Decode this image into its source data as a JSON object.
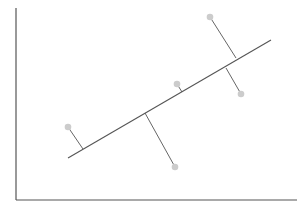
{
  "diagram": {
    "type": "regression-perpendicular-residuals",
    "colors": {
      "background": "#ffffff",
      "axis": "#555555",
      "fit_line": "#555555",
      "residual": "#666666",
      "point": "#cccccc"
    },
    "axes": {
      "y_axis": {
        "x1": 16,
        "y1": 8,
        "x2": 16,
        "y2": 200
      },
      "x_axis": {
        "x1": 16,
        "y1": 200,
        "x2": 297,
        "y2": 200
      }
    },
    "fit_line": {
      "x1": 68,
      "y1": 158,
      "x2": 271,
      "y2": 40
    },
    "points": [
      {
        "x": 68,
        "y": 127,
        "foot_x": 83,
        "foot_y": 149
      },
      {
        "x": 177,
        "y": 84,
        "foot_x": 182,
        "foot_y": 92
      },
      {
        "x": 210,
        "y": 17,
        "foot_x": 236,
        "foot_y": 58
      },
      {
        "x": 241,
        "y": 94,
        "foot_x": 226,
        "foot_y": 68
      },
      {
        "x": 175,
        "y": 167,
        "foot_x": 145,
        "foot_y": 113
      }
    ]
  }
}
